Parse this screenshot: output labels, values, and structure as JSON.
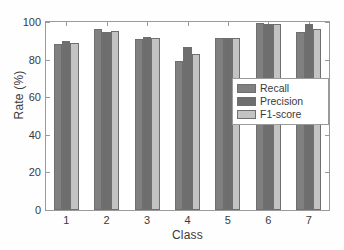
{
  "chart_data": {
    "type": "bar",
    "title": "",
    "subtitle": "",
    "xlabel": "Class",
    "ylabel": "Rate (%)",
    "categories": [
      "1",
      "2",
      "3",
      "4",
      "5",
      "6",
      "7"
    ],
    "series": [
      {
        "name": "Recall",
        "color": "#808080",
        "values": [
          88.3,
          96.1,
          91.0,
          79.3,
          91.4,
          99.3,
          94.5
        ]
      },
      {
        "name": "Precision",
        "color": "#6e6e6e",
        "values": [
          90.0,
          94.5,
          92.1,
          86.7,
          91.5,
          98.7,
          98.7
        ]
      },
      {
        "name": "F1-score",
        "color": "#c3c3c3",
        "values": [
          89.1,
          95.3,
          91.5,
          82.8,
          91.4,
          99.0,
          96.5
        ]
      }
    ],
    "ylim": [
      0,
      100
    ],
    "yticks": [
      0,
      20,
      40,
      60,
      80,
      100
    ],
    "ytick_labels": [
      "0",
      "20",
      "40",
      "60",
      "80",
      "100"
    ],
    "grid": false,
    "legend_position": "right-middle",
    "legend_entries": [
      "Recall",
      "Precision",
      "F1-score"
    ],
    "bar_edge_color": "#6f6f6f",
    "axis_color": "#9a9a9a",
    "text_color": "#3a3a3a",
    "background": "#ffffff"
  }
}
